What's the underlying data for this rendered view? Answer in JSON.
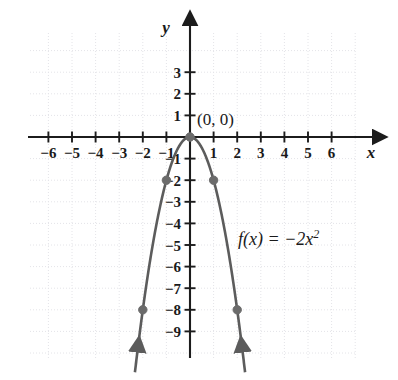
{
  "chart_data": {
    "type": "line",
    "title": "",
    "subtitle": "",
    "xlabel": "x",
    "ylabel": "y",
    "xlim": [
      -7,
      7
    ],
    "ylim": [
      -9.8,
      3.8
    ],
    "grid": true,
    "grid_step": 1,
    "legend": "none",
    "function_label": "f(x) = −2x",
    "function_exponent": "2",
    "equation": "f(x) = -2x^2",
    "x_ticks": [
      -6,
      -5,
      -4,
      -3,
      -2,
      -1,
      1,
      2,
      3,
      4,
      5,
      6
    ],
    "x_tick_labels": [
      "−6",
      "−5",
      "−4",
      "−3",
      "−2",
      "−1",
      "1",
      "2",
      "3",
      "4",
      "5",
      "6"
    ],
    "y_ticks": [
      3,
      2,
      1,
      -1,
      -2,
      -3,
      -4,
      -5,
      -6,
      -7,
      -8,
      -9
    ],
    "y_tick_labels": [
      "3",
      "2",
      "1",
      "−1",
      "−2",
      "−3",
      "−4",
      "−5",
      "−6",
      "−7",
      "−8",
      "−9"
    ],
    "series": [
      {
        "name": "f(x) = -2x^2",
        "type": "parabola",
        "color": "#5c5c5c",
        "x": [
          -2.15,
          -2.0,
          -1.5,
          -1.0,
          -0.5,
          0.0,
          0.5,
          1.0,
          1.5,
          2.0,
          2.15
        ],
        "y": [
          -9.245,
          -8.0,
          -4.5,
          -2.0,
          -0.5,
          0.0,
          -0.5,
          -2.0,
          -4.5,
          -8.0,
          -9.245
        ],
        "arrow_ends": [
          "start",
          "end"
        ]
      }
    ],
    "points": [
      {
        "label": "(0, 0)",
        "x": 0,
        "y": 0,
        "marked": true,
        "annotated": true
      },
      {
        "label": "(-1, -2)",
        "x": -1,
        "y": -2,
        "marked": true,
        "annotated": false
      },
      {
        "label": "(1, -2)",
        "x": 1,
        "y": -2,
        "marked": true,
        "annotated": false
      },
      {
        "label": "(-2, -8)",
        "x": -2,
        "y": -8,
        "marked": true,
        "annotated": false
      },
      {
        "label": "(2, -8)",
        "x": 2,
        "y": -8,
        "marked": true,
        "annotated": false
      }
    ],
    "annotations": [
      {
        "name": "vertex-label",
        "text": "(0, 0)",
        "x": 0.35,
        "y": 0.75
      },
      {
        "name": "function-label",
        "text": "f(x) = −2x²",
        "x": 2.1,
        "y": -4.6
      }
    ],
    "colors": {
      "curve": "#5c5c5c",
      "axis": "#1c1c1c",
      "grid": "#e4e4e8",
      "point": "#6b6b6b",
      "text": "#1a1a1a",
      "background": "#ffffff"
    }
  },
  "axes": {
    "y_axis_label": "y",
    "x_axis_label": "x"
  }
}
